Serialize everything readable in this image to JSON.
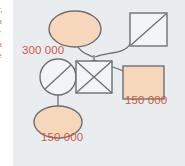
{
  "figure": {
    "kind": "pedigree-inheritance-diagram",
    "panel_background": "#e9edef",
    "page_background": "#ffffff",
    "label_color": "#d3573f",
    "shape_fill_inherited": "#f7d7bc",
    "shape_fill_empty": "#f2f5f6",
    "shape_stroke": "#6e6f73",
    "link_stroke": "#6e6f73"
  },
  "margin": {
    "clipped_text": "r,\na\nr\na\ne"
  },
  "labels": {
    "father_amount": "300 000",
    "son_amount": "150 000",
    "grandchild_amount": "150 000"
  },
  "nodes": [
    {
      "id": "father",
      "shape": "ellipse",
      "role": "parent-female",
      "fill": "inherited",
      "deceased": false,
      "amount": "300 000"
    },
    {
      "id": "mother",
      "shape": "square",
      "role": "parent-male-deceased",
      "fill": "empty",
      "deceased": true,
      "amount": ""
    },
    {
      "id": "child-1",
      "shape": "circle",
      "role": "child-female-deceased",
      "fill": "empty",
      "deceased": true,
      "amount": ""
    },
    {
      "id": "child-2",
      "shape": "square",
      "role": "child-male-excluded",
      "fill": "empty",
      "deceased": true,
      "amount": ""
    },
    {
      "id": "child-3",
      "shape": "square",
      "role": "child-male-heir",
      "fill": "inherited",
      "deceased": false,
      "amount": "150 000"
    },
    {
      "id": "grandchild",
      "shape": "ellipse",
      "role": "grandchild-female-heir",
      "fill": "inherited",
      "deceased": false,
      "amount": "150 000"
    }
  ]
}
